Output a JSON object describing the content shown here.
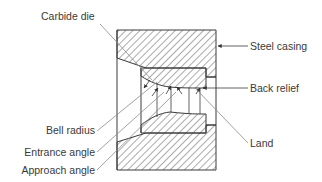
{
  "diagram": {
    "type": "cross-section",
    "colors": {
      "line": "#3a3a3a",
      "hatch": "#555555",
      "leader": "#8a8a8a",
      "background": "#ffffff"
    },
    "labels": {
      "carbide_die": "Carbide die",
      "steel_casing": "Steel casing",
      "back_relief": "Back relief",
      "land": "Land",
      "bell_radius": "Bell radius",
      "entrance_angle": "Entrance angle",
      "approach_angle": "Approach angle"
    },
    "components": [
      {
        "id": "steel-casing",
        "label": "Steel casing",
        "fill": "hatched"
      },
      {
        "id": "carbide-die",
        "label": "Carbide die",
        "fill": "hatched"
      },
      {
        "id": "back-relief",
        "label": "Back relief"
      },
      {
        "id": "land",
        "label": "Land"
      },
      {
        "id": "bell-radius",
        "label": "Bell radius"
      },
      {
        "id": "entrance-angle",
        "label": "Entrance angle"
      },
      {
        "id": "approach-angle",
        "label": "Approach angle"
      }
    ]
  }
}
